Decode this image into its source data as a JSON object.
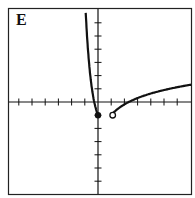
{
  "panel": {
    "label": "E"
  },
  "chart_data": {
    "type": "line",
    "title": "E",
    "xlabel": "",
    "ylabel": "",
    "xlim": [
      -6,
      7
    ],
    "ylim": [
      -6,
      7
    ],
    "grid": false,
    "tick_spacing": 1,
    "series": [
      {
        "name": "left branch",
        "x": [
          -1.4,
          -1.0,
          -0.6,
          -0.2,
          0
        ],
        "y": [
          7,
          4.5,
          2,
          0.3,
          -1
        ],
        "endpoint": {
          "x": 0,
          "y": -1,
          "style": "closed"
        }
      },
      {
        "name": "right branch",
        "x": [
          1,
          2,
          3,
          5,
          7
        ],
        "y": [
          -1,
          -0.4,
          0,
          0.5,
          0.9
        ],
        "endpoint": {
          "x": 1,
          "y": -1,
          "style": "open"
        }
      }
    ],
    "colors": {
      "curve": "#111111",
      "axis": "#111111"
    }
  }
}
